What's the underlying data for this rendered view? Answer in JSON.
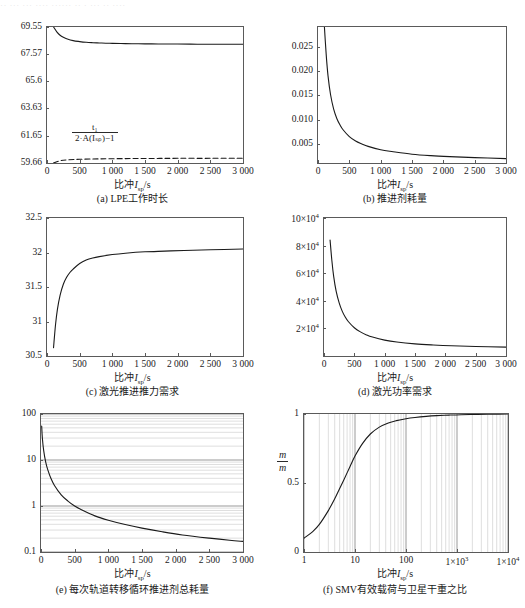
{
  "top_strip_text": "·· ···  ··· ···· ······  ·· · ··· ·· ····",
  "common": {
    "xlabel_prefix": "比冲",
    "xlabel_symbol": "I",
    "xlabel_subscript": "sp",
    "xlabel_unit": "/s"
  },
  "chart_data": [
    {
      "id": "a",
      "type": "line",
      "caption": "(a) LPE工作时长",
      "title": "",
      "xlabel": "比冲I_sp/s",
      "ylabel": "",
      "xlim": [
        0,
        3000
      ],
      "ylim": [
        59.66,
        69.55
      ],
      "xticks": [
        0,
        500,
        1000,
        1500,
        2000,
        2500,
        3000
      ],
      "xticklabels": [
        "0",
        "500",
        "1 000",
        "1 500",
        "2 000",
        "2 500",
        "3 000"
      ],
      "yticks": [
        59.66,
        61.65,
        63.63,
        65.6,
        67.57,
        69.55
      ],
      "yticklabels": [
        "59.66",
        "61.65",
        "63.63",
        "65.6",
        "67.57",
        "69.55"
      ],
      "grid": false,
      "annotation": {
        "numerator": "t₁",
        "denominator": "2·A(Iₛₚ)−1"
      },
      "series": [
        {
          "name": "LPE work duration",
          "style": "solid",
          "x": [
            100,
            150,
            200,
            250,
            300,
            400,
            500,
            600,
            700,
            800,
            900,
            1000,
            1200,
            1400,
            1600,
            1800,
            2000,
            2300,
            2600,
            3000
          ],
          "values": [
            69.55,
            69.2,
            68.95,
            68.8,
            68.7,
            68.56,
            68.49,
            68.44,
            68.41,
            68.39,
            68.37,
            68.36,
            68.34,
            68.33,
            68.32,
            68.31,
            68.31,
            68.3,
            68.3,
            68.3
          ]
        },
        {
          "name": "t1/(2A(Isp)-1)",
          "style": "dashed",
          "x": [
            100,
            200,
            300,
            500,
            800,
            1200,
            1600,
            2000,
            2500,
            3000
          ],
          "values": [
            59.66,
            59.82,
            59.88,
            59.93,
            59.96,
            59.98,
            59.99,
            60.0,
            60.0,
            60.01
          ]
        }
      ]
    },
    {
      "id": "b",
      "type": "line",
      "caption": "(b) 推进剂耗量",
      "title": "",
      "xlabel": "比冲I_sp/s",
      "ylabel": "",
      "xlim": [
        0,
        3000
      ],
      "ylim": [
        0.0012,
        0.029
      ],
      "xticks": [
        0,
        500,
        1000,
        1500,
        2000,
        2500,
        3000
      ],
      "xticklabels": [
        "0",
        "500",
        "1 000",
        "1 500",
        "2 000",
        "2 500",
        "3 000"
      ],
      "yticks": [
        0.005,
        0.01,
        0.015,
        0.02,
        0.025
      ],
      "yticklabels": [
        "0.005",
        "0.010",
        "0.015",
        "0.020",
        "0.025"
      ],
      "grid": false,
      "series": [
        {
          "name": "propellant mass",
          "style": "solid",
          "x": [
            100,
            130,
            160,
            200,
            250,
            300,
            350,
            400,
            500,
            600,
            700,
            800,
            1000,
            1200,
            1500,
            1800,
            2100,
            2500,
            3000
          ],
          "values": [
            0.0295,
            0.0235,
            0.019,
            0.0152,
            0.0122,
            0.0103,
            0.009,
            0.008,
            0.0066,
            0.0057,
            0.0051,
            0.0046,
            0.0039,
            0.0035,
            0.003,
            0.0027,
            0.0025,
            0.0023,
            0.0021
          ]
        }
      ]
    },
    {
      "id": "c",
      "type": "line",
      "caption": "(c) 激光推进推力需求",
      "title": "",
      "xlabel": "比冲I_sp/s",
      "ylabel": "",
      "xlim": [
        0,
        3000
      ],
      "ylim": [
        30.5,
        32.5
      ],
      "xticks": [
        0,
        500,
        1000,
        1500,
        2000,
        2500,
        3000
      ],
      "xticklabels": [
        "0",
        "500",
        "1 000",
        "1 500",
        "2 000",
        "2 500",
        "3 000"
      ],
      "yticks": [
        30.5,
        31,
        31.5,
        32,
        32.5
      ],
      "yticklabels": [
        "30.5",
        "31",
        "31.5",
        "32",
        "32.5"
      ],
      "grid": false,
      "series": [
        {
          "name": "laser thrust requirement",
          "style": "solid",
          "x": [
            100,
            130,
            160,
            200,
            250,
            300,
            350,
            400,
            500,
            600,
            700,
            800,
            1000,
            1200,
            1500,
            1800,
            2100,
            2500,
            3000
          ],
          "values": [
            30.62,
            30.95,
            31.18,
            31.38,
            31.54,
            31.64,
            31.71,
            31.76,
            31.84,
            31.89,
            31.92,
            31.94,
            31.97,
            31.99,
            32.01,
            32.02,
            32.03,
            32.04,
            32.05
          ]
        }
      ]
    },
    {
      "id": "d",
      "type": "line",
      "caption": "(d) 激光功率需求",
      "title": "",
      "xlabel": "比冲I_sp/s",
      "ylabel": "",
      "xlim": [
        0,
        3000
      ],
      "ylim": [
        0,
        100000
      ],
      "xticks": [
        0,
        500,
        1000,
        1500,
        2000,
        2500,
        3000
      ],
      "xticklabels": [
        "0",
        "500",
        "1 000",
        "1 500",
        "2 000",
        "2 500",
        "3 000"
      ],
      "yticks": [
        20000,
        40000,
        60000,
        80000,
        100000
      ],
      "yticklabels": [
        "2×10⁴",
        "4×10⁴",
        "6×10⁴",
        "8×10⁴",
        "10×10⁴"
      ],
      "grid": false,
      "series": [
        {
          "name": "laser power requirement",
          "style": "solid",
          "x": [
            100,
            130,
            160,
            200,
            250,
            300,
            350,
            400,
            500,
            600,
            700,
            800,
            1000,
            1200,
            1500,
            1800,
            2100,
            2500,
            3000
          ],
          "values": [
            84000,
            69000,
            57500,
            47000,
            38500,
            32500,
            28200,
            25000,
            20500,
            17500,
            15300,
            13700,
            11500,
            10100,
            8800,
            8000,
            7400,
            6900,
            6400
          ]
        }
      ]
    },
    {
      "id": "e",
      "type": "line",
      "caption": "(e) 每次轨道转移循环推进剂总耗量",
      "title": "",
      "xlabel": "比冲I_sp/s",
      "ylabel": "",
      "xlim": [
        0,
        3000
      ],
      "ylim": [
        0.1,
        100
      ],
      "yscale": "log",
      "xticks": [
        0,
        500,
        1000,
        1500,
        2000,
        2500,
        3000
      ],
      "xticklabels": [
        "0",
        "500",
        "1 000",
        "1 500",
        "2 000",
        "2 500",
        "3 000"
      ],
      "yticks": [
        0.1,
        1,
        10,
        100
      ],
      "yticklabels": [
        "0.1",
        "1",
        "10",
        "100"
      ],
      "grid": true,
      "series": [
        {
          "name": "total propellant per transfer cycle",
          "style": "solid",
          "x": [
            10,
            20,
            40,
            70,
            100,
            150,
            200,
            300,
            400,
            500,
            600,
            800,
            1000,
            1250,
            1500,
            1800,
            2100,
            2500,
            2800,
            3000
          ],
          "values": [
            55,
            30,
            16,
            9.0,
            6.2,
            3.9,
            2.8,
            1.75,
            1.28,
            1.0,
            0.83,
            0.61,
            0.49,
            0.395,
            0.33,
            0.275,
            0.235,
            0.2,
            0.18,
            0.17
          ]
        }
      ]
    },
    {
      "id": "f",
      "type": "line",
      "caption": "(f) SMV有效载荷与卫星干重之比",
      "title": "",
      "xlabel": "比冲I_sp/s",
      "ylabel": "m/m",
      "ylabel_numerator": "m",
      "ylabel_denominator": "m",
      "xlim": [
        1,
        10000
      ],
      "ylim": [
        0,
        1
      ],
      "xscale": "log",
      "xticks": [
        1,
        10,
        100,
        1000,
        10000
      ],
      "xticklabels": [
        "1",
        "10",
        "100",
        "1×10³",
        "1×10⁴"
      ],
      "yticks": [
        0,
        0.5,
        1
      ],
      "yticklabels": [
        "0",
        "0.5",
        "1"
      ],
      "grid": true,
      "series": [
        {
          "name": "payload to satellite dry mass ratio",
          "style": "solid",
          "x": [
            1,
            1.5,
            2,
            3,
            4,
            5,
            6,
            8,
            10,
            14,
            20,
            30,
            45,
            65,
            100,
            150,
            250,
            400,
            700,
            1200,
            2500,
            5000,
            10000
          ],
          "values": [
            0.1,
            0.15,
            0.2,
            0.3,
            0.385,
            0.46,
            0.52,
            0.62,
            0.695,
            0.785,
            0.855,
            0.905,
            0.935,
            0.952,
            0.966,
            0.975,
            0.983,
            0.988,
            0.992,
            0.995,
            0.997,
            0.999,
            1.0
          ]
        }
      ]
    }
  ]
}
